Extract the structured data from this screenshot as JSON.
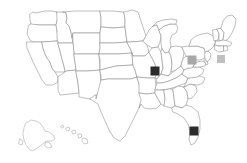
{
  "map": {
    "title": "United States state outline map",
    "region": "United States of America",
    "projection": "albers-usa",
    "background_color": "#ffffff",
    "state_fill_color": "#ffffff",
    "state_border_color": "#888888",
    "includes_insets": [
      "Alaska",
      "Hawaii"
    ],
    "has_labels": false,
    "has_legend": false,
    "has_title_text": false
  },
  "markers": [
    {
      "id": "marker-illinois",
      "state": "Illinois",
      "shape": "square",
      "color": "#2b2b2b",
      "x": 155,
      "y": 71,
      "size": 9
    },
    {
      "id": "marker-pennsylvania",
      "state": "Pennsylvania",
      "shape": "square",
      "color": "#a8a8a8",
      "x": 192,
      "y": 60,
      "size": 9
    },
    {
      "id": "marker-connecticut",
      "state": "Connecticut",
      "shape": "square",
      "color": "#c0c0c0",
      "x": 221,
      "y": 59,
      "size": 8
    },
    {
      "id": "marker-florida",
      "state": "Florida",
      "shape": "square",
      "color": "#2b2b2b",
      "x": 194,
      "y": 131,
      "size": 9
    }
  ],
  "insets": {
    "alaska": {
      "name": "Alaska",
      "x": 22,
      "y": 122
    },
    "hawaii": {
      "name": "Hawaii",
      "x": 62,
      "y": 126
    }
  }
}
